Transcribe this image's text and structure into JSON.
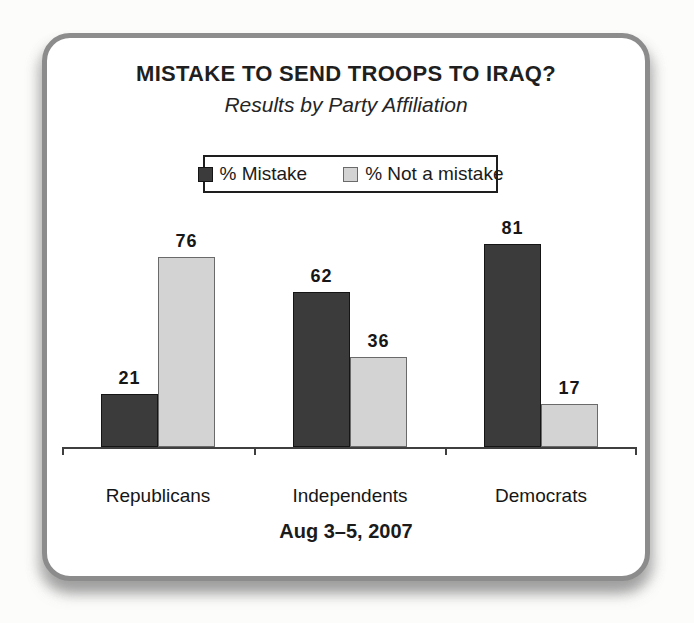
{
  "chart_data": {
    "type": "bar",
    "title": "MISTAKE TO SEND TROOPS TO IRAQ?",
    "subtitle": "Results by Party Affiliation",
    "note": "Aug 3–5, 2007",
    "categories": [
      "Republicans",
      "Independents",
      "Democrats"
    ],
    "series": [
      {
        "name": "% Mistake",
        "values": [
          21,
          62,
          81
        ],
        "color": "#3b3b3b",
        "border_color": "#151515"
      },
      {
        "name": "% Not a mistake",
        "values": [
          76,
          36,
          17
        ],
        "color": "#d3d3d3",
        "border_color": "#6a6a6a"
      }
    ],
    "ylim": [
      0,
      100
    ],
    "grid": false,
    "legend_position": "top",
    "value_labels": true,
    "axis_color": "#3f3f3f"
  }
}
